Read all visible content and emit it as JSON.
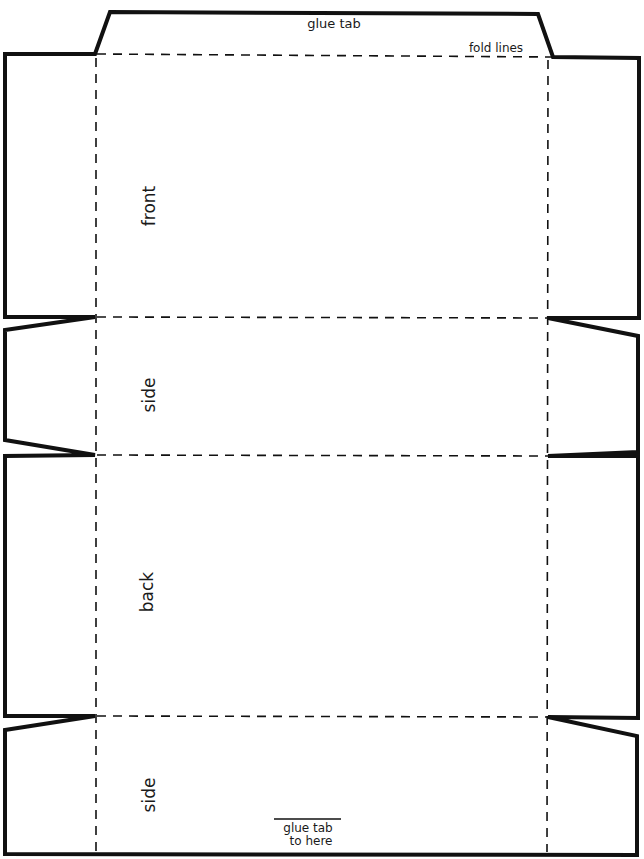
{
  "diagram": {
    "type": "box template (cut and fold)",
    "labels": {
      "glue_tab": "glue tab",
      "fold_lines": "fold lines",
      "glue_target_line1": "glue tab",
      "glue_target_line2": "to here"
    },
    "panels": [
      {
        "name": "front",
        "label": "front"
      },
      {
        "name": "side-1",
        "label": "side"
      },
      {
        "name": "back",
        "label": "back"
      },
      {
        "name": "side-2",
        "label": "side"
      }
    ],
    "colors": {
      "line": "#111111",
      "background": "#ffffff"
    }
  }
}
